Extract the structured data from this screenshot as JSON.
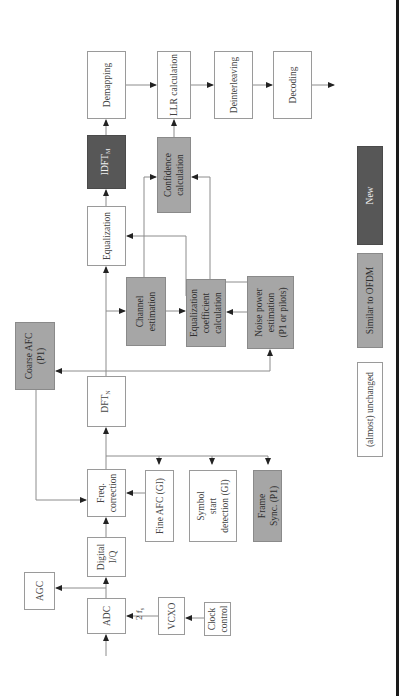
{
  "diagram": {
    "blocks": {
      "adc": "ADC",
      "agc": "AGC",
      "digital_iq": "Digital\nI/Q",
      "freq_correction": "Freq.\ncorrection",
      "vcxo": "VCXO",
      "clock_control": "Clock\ncontrol",
      "fine_afc": "Fine AFC (GI)",
      "symbol_start": "Symbol\nstart\ndetection (GI)",
      "frame_sync": "Frame\nSync. (P1)",
      "dft": "DFT",
      "dft_sub": "N",
      "coarse_afc": "Coarse AFC\n(P1)",
      "channel_estimation": "Channel\nestimation",
      "equalization": "Equalization",
      "eq_coeff": "Equalization\ncoefficient\ncalculation",
      "noise_power": "Noise power\nestimation\n(P1 or pilots)",
      "idft": "IDFT",
      "idft_sub": "M",
      "confidence": "Confidence\ncalculation",
      "demapping": "Demapping",
      "llr": "LLR calculation",
      "deinterleaving": "Deinterleaving",
      "decoding": "Decoding"
    },
    "labels": {
      "clock_freq": "2 f",
      "clock_freq_sub": "s"
    },
    "legend": {
      "unchanged": "(almost) unchanged",
      "similar": "Similar to OFDM",
      "new": "New"
    },
    "colors": {
      "unchanged": "#ffffff",
      "similar": "#a6a6a6",
      "new": "#575757"
    }
  }
}
